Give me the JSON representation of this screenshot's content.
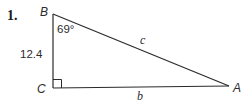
{
  "figure": {
    "problem_number": "1.",
    "vertices": {
      "top": "B",
      "bottom_left": "C",
      "right": "A"
    },
    "angle_at_B": "69°",
    "side_BC_length": "12.4",
    "hypotenuse_label": "c",
    "base_label": "b",
    "right_angle_marker_at": "C",
    "line_color": "#2b2b2b",
    "background_color": "#ffffff"
  }
}
